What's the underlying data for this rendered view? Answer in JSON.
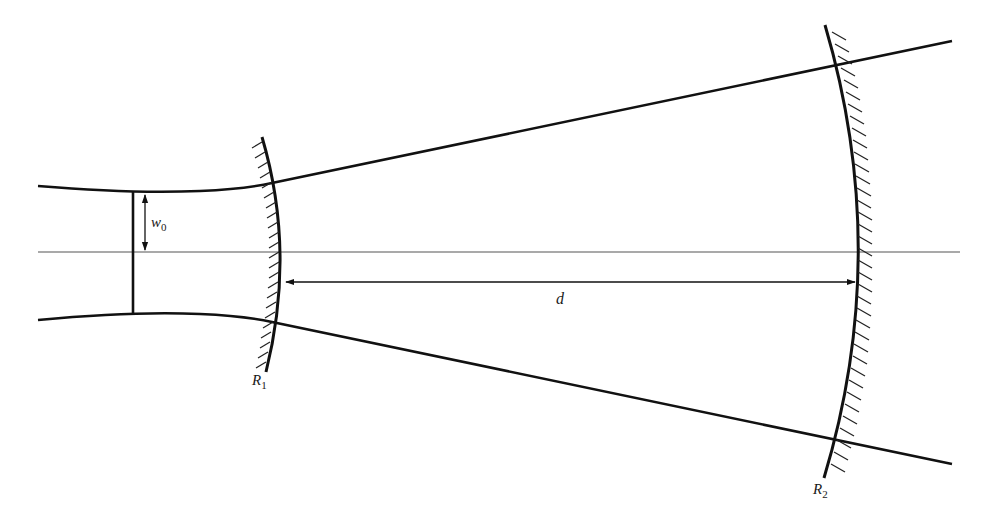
{
  "diagram": {
    "colors": {
      "ink": "#111111",
      "axis": "#555555",
      "background": "#ffffff"
    },
    "labels": {
      "waist": {
        "main": "w",
        "sub": "0"
      },
      "distance": "d",
      "mirror1": {
        "main": "R",
        "sub": "1"
      },
      "mirror2": {
        "main": "R",
        "sub": "2"
      }
    },
    "elements": [
      {
        "id": "optical-axis",
        "type": "line"
      },
      {
        "id": "beam-upper-envelope",
        "type": "curve"
      },
      {
        "id": "beam-lower-envelope",
        "type": "curve"
      },
      {
        "id": "waist-line",
        "type": "line"
      },
      {
        "id": "waist-arrow",
        "type": "double-arrow",
        "label": "w0"
      },
      {
        "id": "mirror-1",
        "type": "concave-mirror",
        "label": "R1",
        "hatch_side": "left"
      },
      {
        "id": "mirror-2",
        "type": "concave-mirror",
        "label": "R2",
        "hatch_side": "right"
      },
      {
        "id": "distance-arrow",
        "type": "double-arrow",
        "label": "d"
      }
    ]
  }
}
